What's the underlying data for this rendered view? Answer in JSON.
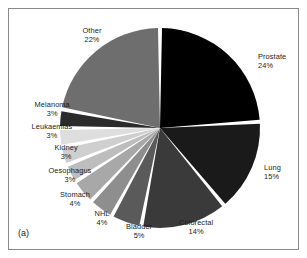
{
  "figure": {
    "panel_caption": "(a)",
    "background_color": "#ffffff",
    "frame_color": "#8a8a8a",
    "separator_color": "#ffffff"
  },
  "chart_data": {
    "type": "pie",
    "title": "",
    "subtitle": "",
    "xlabel": "",
    "ylabel": "",
    "legend_position": "none",
    "grid": false,
    "units": "percent",
    "start_angle_deg": 0,
    "direction": "clockwise",
    "categories": [
      "Prostate",
      "Lung",
      "Colorectal",
      "Bladder",
      "NHL",
      "Stomach",
      "Oesophagus",
      "Kidney",
      "Leukaemias",
      "Melanoma",
      "Other"
    ],
    "values": [
      24,
      15,
      14,
      5,
      4,
      4,
      3,
      3,
      3,
      3,
      22
    ],
    "slices": [
      {
        "label": "Prostate",
        "value": 24,
        "value_text": "24%",
        "color": "#000000",
        "label_x": 258,
        "label_y": 52,
        "align": "lab-right"
      },
      {
        "label": "Lung",
        "value": 15,
        "value_text": "15%",
        "color": "#1a1a1a",
        "label_x": 264,
        "label_y": 163,
        "align": "lab-right"
      },
      {
        "label": "Colorectal",
        "value": 14,
        "value_text": "14%",
        "color": "#3a3a3a",
        "label_x": 196,
        "label_y": 218,
        "align": "lab-center"
      },
      {
        "label": "Bladder",
        "value": 5,
        "value_text": "5%",
        "color": "#5a5a5a",
        "label_x": 139,
        "label_y": 222,
        "align": "lab-center"
      },
      {
        "label": "NHL",
        "value": 4,
        "value_text": "4%",
        "color": "#8e8e8e",
        "label_x": 102,
        "label_y": 209,
        "align": "lab-center"
      },
      {
        "label": "Stomach",
        "value": 4,
        "value_text": "4%",
        "color": "#a8a8a8",
        "label_x": 75,
        "label_y": 190,
        "align": "lab-center"
      },
      {
        "label": "Oesophagus",
        "value": 3,
        "value_text": "3%",
        "color": "#bdbdbd",
        "label_x": 70,
        "label_y": 166,
        "align": "lab-center"
      },
      {
        "label": "Kidney",
        "value": 3,
        "value_text": "3%",
        "color": "#cfcfcf",
        "label_x": 66,
        "label_y": 143,
        "align": "lab-center"
      },
      {
        "label": "Leukaemias",
        "value": 3,
        "value_text": "3%",
        "color": "#dedede",
        "label_x": 52,
        "label_y": 122,
        "align": "lab-center"
      },
      {
        "label": "Melanoma",
        "value": 3,
        "value_text": "3%",
        "color": "#2b2b2b",
        "label_x": 52,
        "label_y": 100,
        "align": "lab-center"
      },
      {
        "label": "Other",
        "value": 22,
        "value_text": "22%",
        "color": "#6e6e6e",
        "label_x": 92,
        "label_y": 26,
        "align": "lab-center"
      }
    ],
    "geometry": {
      "center_x": 160,
      "center_y": 128,
      "radius": 100
    }
  }
}
